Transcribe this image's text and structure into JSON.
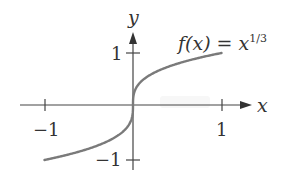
{
  "chart_data": {
    "type": "line",
    "title": "",
    "function_label": {
      "f": "f(x) = x",
      "exponent": "1/3"
    },
    "xlabel": "x",
    "ylabel": "y",
    "x_ticks": [
      {
        "value": -1,
        "label": "−1"
      },
      {
        "value": 1,
        "label": "1"
      }
    ],
    "y_ticks": [
      {
        "value": 1,
        "label": "1"
      },
      {
        "value": -1,
        "label": "−1"
      }
    ],
    "xlim": [
      -1.2,
      1.15
    ],
    "ylim": [
      -1.1,
      1.45
    ],
    "grid": false,
    "legend": "none",
    "series": [
      {
        "name": "f(x) = x^(1/3)",
        "x": [
          -1,
          -0.8,
          -0.6,
          -0.4,
          -0.2,
          -0.1,
          -0.05,
          -0.01,
          0,
          0.01,
          0.05,
          0.1,
          0.2,
          0.4,
          0.6,
          0.8,
          1
        ],
        "y": [
          -1,
          -0.928,
          -0.843,
          -0.737,
          -0.585,
          -0.464,
          -0.368,
          -0.215,
          0,
          0.215,
          0.368,
          0.464,
          0.585,
          0.737,
          0.843,
          0.928,
          1
        ]
      }
    ],
    "colors": {
      "curve": "#7a7a7a",
      "axes": "#444444",
      "labels": "#333333"
    }
  }
}
